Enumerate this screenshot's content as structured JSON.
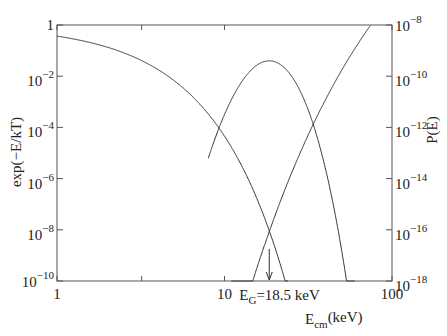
{
  "chart_data": {
    "type": "line",
    "title": "",
    "xlabel": "E_cm(keV)",
    "xlabel_main": "E",
    "xlabel_sub": "cm",
    "xlabel_unit": "(keV)",
    "ylabel_left": "exp(−E/kT)",
    "ylabel_right": "P(E)",
    "xscale": "log",
    "yscale_left": "log",
    "yscale_right": "log",
    "xlim": [
      1,
      100
    ],
    "ylim_left": [
      1e-10,
      1
    ],
    "ylim_right": [
      1e-18,
      1e-08
    ],
    "grid": false,
    "legend": "none",
    "x_ticks": [
      {
        "value": 1,
        "label": "1"
      },
      {
        "value": 10,
        "label": "10"
      },
      {
        "value": 100,
        "label": "100"
      }
    ],
    "y_left_ticks": [
      {
        "exp": 0,
        "label_base": "1",
        "label_exp": ""
      },
      {
        "exp": -2,
        "label_base": "10",
        "label_exp": "−2"
      },
      {
        "exp": -4,
        "label_base": "10",
        "label_exp": "−4"
      },
      {
        "exp": -6,
        "label_base": "10",
        "label_exp": "−6"
      },
      {
        "exp": -8,
        "label_base": "10",
        "label_exp": "−8"
      },
      {
        "exp": -10,
        "label_base": "10",
        "label_exp": "−10"
      }
    ],
    "y_right_ticks": [
      {
        "exp": -8,
        "label_base": "10",
        "label_exp": "−8"
      },
      {
        "exp": -10,
        "label_base": "10",
        "label_exp": "−10"
      },
      {
        "exp": -12,
        "label_base": "10",
        "label_exp": "−12"
      },
      {
        "exp": -14,
        "label_base": "10",
        "label_exp": "−14"
      },
      {
        "exp": -16,
        "label_base": "10",
        "label_exp": "−16"
      },
      {
        "exp": -18,
        "label_base": "10",
        "label_exp": "−18"
      }
    ],
    "series": [
      {
        "name": "Maxwell-Boltzmann exp(-E/kT)",
        "axis": "left",
        "kT_keV": 1.0,
        "x": [
          1,
          2,
          3,
          5,
          8,
          10,
          15,
          18.5,
          23
        ],
        "values": [
          0.37,
          0.135,
          0.05,
          0.0067,
          0.00034,
          4.5e-05,
          3.1e-07,
          9.3e-09,
          1e-10
        ]
      },
      {
        "name": "Tunneling probability exp(-sqrt(E_G/E))",
        "axis": "right",
        "E_G_keV": 25327,
        "x": [
          12,
          15,
          18.5,
          25,
          35,
          50,
          65,
          80
        ],
        "values": [
          1.3e-20,
          1.3e-18,
          8.5e-17,
          1.4e-14,
          2e-12,
          1.7e-10,
          2.6e-09,
          1.9e-08
        ]
      },
      {
        "name": "Gamow peak (product, scaled)",
        "axis": "right",
        "x": [
          10,
          13,
          15,
          17,
          18.5,
          20,
          22,
          25,
          30
        ],
        "values": [
          1e-18,
          5e-15,
          4e-12,
          3e-10,
          1.6e-09,
          4e-10,
          4e-12,
          3e-15,
          1e-18
        ]
      }
    ],
    "annotations": [
      {
        "type": "arrow",
        "x": 18.5,
        "label_main": "E",
        "label_sub": "G",
        "label_rest": "=18.5 keV"
      }
    ]
  }
}
